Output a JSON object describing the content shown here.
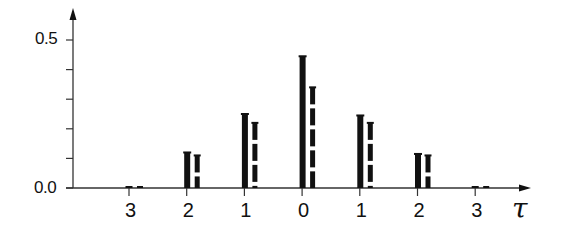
{
  "chart_data": {
    "type": "bar",
    "title": "",
    "xlabel": "τ",
    "ylabel": "",
    "categories": [
      "3",
      "2",
      "1",
      "0",
      "1",
      "2",
      "3"
    ],
    "x": [
      -3,
      -2,
      -1,
      0,
      1,
      2,
      3
    ],
    "series": [
      {
        "name": "solid",
        "style": "solid",
        "values": [
          0.005,
          0.12,
          0.25,
          0.445,
          0.245,
          0.115,
          0.005
        ]
      },
      {
        "name": "dashed",
        "style": "dashed",
        "values": [
          0.004,
          0.11,
          0.22,
          0.34,
          0.22,
          0.11,
          0.004
        ]
      }
    ],
    "yticks": [
      0.0,
      0.1,
      0.2,
      0.3,
      0.4,
      0.5
    ],
    "ytick_labels": [
      "0.0",
      "0.5"
    ],
    "ylim": [
      0.0,
      0.55
    ],
    "grid": false,
    "legend": null
  },
  "axes": {
    "y_label_top": "0.5",
    "y_label_bottom": "0.0",
    "x_axis_symbol": "τ"
  },
  "colors": {
    "ink": "#111111",
    "background": "#ffffff"
  }
}
